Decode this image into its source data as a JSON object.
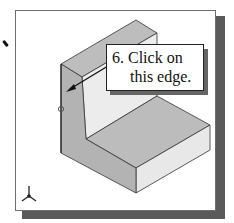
{
  "viewport": {
    "background": "#ffffff",
    "border_color": "#6e6e6e",
    "shadow_color": "#5a5a5a"
  },
  "model": {
    "type": "L-bracket isometric solid",
    "face_colors": {
      "top": "#bdbdbd",
      "front_left": "#b3b3b3",
      "right": "#e6e6e6",
      "inner_wall": "#ececec"
    },
    "edge_color": "#333333"
  },
  "callout": {
    "line1": "6. Click on",
    "line2": "this edge."
  },
  "triad": {
    "label": "coordinate-triad"
  }
}
